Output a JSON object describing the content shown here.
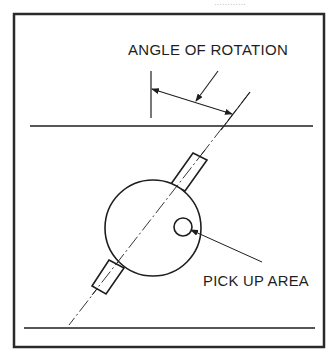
{
  "figure": {
    "type": "technical-line-drawing",
    "header_fragment": "…………",
    "labels": {
      "angle_of_rotation": "ANGLE OF ROTATION",
      "pick_up_area": "PICK UP AREA"
    },
    "colors": {
      "stroke": "#1e1e1e",
      "border": "#2a2a2a",
      "background": "#ffffff"
    },
    "geometry": {
      "frame": {
        "x": 14,
        "y": 14,
        "width": 310,
        "height": 333
      },
      "top_reference_line": {
        "x1": 30,
        "y1": 126,
        "x2": 313,
        "y2": 126
      },
      "bottom_reference_line": {
        "x1": 24,
        "y1": 328,
        "x2": 315,
        "y2": 328
      },
      "rotation_axis": {
        "x1": 250,
        "y1": 92,
        "x2": 69,
        "y2": 325,
        "style": "dash-dot"
      },
      "vertical_reference_tick": {
        "x": 151,
        "y1": 71,
        "y2": 118
      },
      "body_circle": {
        "cx": 153,
        "cy": 228,
        "r": 48
      },
      "pick_up_circle": {
        "cx": 183,
        "cy": 227,
        "r": 9
      },
      "angle_axis_deg_from_vertical": 37.8
    }
  }
}
